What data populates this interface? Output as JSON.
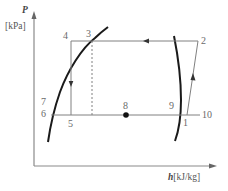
{
  "diagram": {
    "type": "P-h diagram (refrigeration cycle)",
    "y_axis": {
      "symbol": "P",
      "unit": "[kPa]"
    },
    "x_axis": {
      "symbol": "h",
      "unit": "[kJ/kg]"
    },
    "points": [
      {
        "id": "1",
        "label": "1"
      },
      {
        "id": "2",
        "label": "2"
      },
      {
        "id": "3",
        "label": "3"
      },
      {
        "id": "4",
        "label": "4"
      },
      {
        "id": "5",
        "label": "5"
      },
      {
        "id": "6",
        "label": "6"
      },
      {
        "id": "7",
        "label": "7"
      },
      {
        "id": "8",
        "label": "8"
      },
      {
        "id": "9",
        "label": "9"
      },
      {
        "id": "10",
        "label": "10"
      }
    ],
    "paths": [
      {
        "from": "2",
        "to": "4",
        "style": "solid",
        "direction": "leftward arrow"
      },
      {
        "from": "4",
        "to": "5",
        "style": "solid",
        "direction": "downward arrow"
      },
      {
        "from": "3",
        "to": "bottom line",
        "style": "dashed"
      },
      {
        "from": "6",
        "to": "10",
        "style": "solid"
      },
      {
        "from": "1",
        "to": "2",
        "style": "solid",
        "direction": "upward arrow"
      }
    ],
    "curves": [
      {
        "name": "saturated-liquid-line",
        "side": "left"
      },
      {
        "name": "saturated-vapor-line",
        "side": "right"
      }
    ],
    "colors": {
      "line": "#808080",
      "curve": "#1a1a1a",
      "label": "#6a6a6a",
      "axis": "#8a8a8a"
    }
  }
}
